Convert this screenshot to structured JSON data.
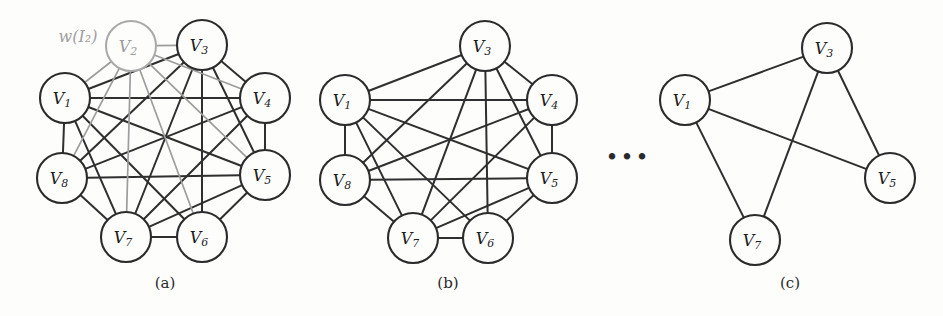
{
  "figure": {
    "width": 943,
    "height": 316,
    "background_color": "#fdfdfc",
    "node_stroke_color": "#2b2b2b",
    "edge_color": "#2f2f2f",
    "faded_color": "#9d9d9d",
    "node_radius": 25,
    "ellipsis_text": "•••",
    "ellipsis_x": 628,
    "ellipsis_y": 158
  },
  "annotation": {
    "label": "w(I₂)",
    "x": 78,
    "y": 36,
    "color": "#a0a0a0"
  },
  "panels": [
    {
      "id": "panel-a",
      "caption": "(a)",
      "caption_x": 165,
      "caption_y": 274,
      "nodes": [
        {
          "id": "V1",
          "label": "V",
          "sub": "1",
          "x": 65,
          "y": 98,
          "faded": false
        },
        {
          "id": "V2",
          "label": "V",
          "sub": "2",
          "x": 131,
          "y": 46,
          "faded": true
        },
        {
          "id": "V3",
          "label": "V",
          "sub": "3",
          "x": 202,
          "y": 45,
          "faded": false
        },
        {
          "id": "V4",
          "label": "V",
          "sub": "4",
          "x": 265,
          "y": 98,
          "faded": false
        },
        {
          "id": "V5",
          "label": "V",
          "sub": "5",
          "x": 265,
          "y": 175,
          "faded": false
        },
        {
          "id": "V6",
          "label": "V",
          "sub": "6",
          "x": 202,
          "y": 237,
          "faded": false
        },
        {
          "id": "V7",
          "label": "V",
          "sub": "7",
          "x": 126,
          "y": 237,
          "faded": false
        },
        {
          "id": "V8",
          "label": "V",
          "sub": "8",
          "x": 62,
          "y": 178,
          "faded": false
        }
      ],
      "edges": [
        {
          "from": "V1",
          "to": "V3",
          "faded": false
        },
        {
          "from": "V1",
          "to": "V4",
          "faded": false
        },
        {
          "from": "V1",
          "to": "V5",
          "faded": false
        },
        {
          "from": "V1",
          "to": "V6",
          "faded": false
        },
        {
          "from": "V1",
          "to": "V7",
          "faded": false
        },
        {
          "from": "V1",
          "to": "V8",
          "faded": false
        },
        {
          "from": "V3",
          "to": "V4",
          "faded": false
        },
        {
          "from": "V3",
          "to": "V5",
          "faded": false
        },
        {
          "from": "V3",
          "to": "V6",
          "faded": false
        },
        {
          "from": "V3",
          "to": "V7",
          "faded": false
        },
        {
          "from": "V3",
          "to": "V8",
          "faded": false
        },
        {
          "from": "V4",
          "to": "V5",
          "faded": false
        },
        {
          "from": "V4",
          "to": "V7",
          "faded": false
        },
        {
          "from": "V4",
          "to": "V8",
          "faded": false
        },
        {
          "from": "V5",
          "to": "V6",
          "faded": false
        },
        {
          "from": "V5",
          "to": "V7",
          "faded": false
        },
        {
          "from": "V5",
          "to": "V8",
          "faded": false
        },
        {
          "from": "V6",
          "to": "V7",
          "faded": false
        },
        {
          "from": "V7",
          "to": "V8",
          "faded": false
        },
        {
          "from": "V2",
          "to": "V1",
          "faded": true
        },
        {
          "from": "V2",
          "to": "V3",
          "faded": true
        },
        {
          "from": "V2",
          "to": "V4",
          "faded": true
        },
        {
          "from": "V2",
          "to": "V5",
          "faded": true
        },
        {
          "from": "V2",
          "to": "V6",
          "faded": true
        },
        {
          "from": "V2",
          "to": "V7",
          "faded": true
        },
        {
          "from": "V2",
          "to": "V8",
          "faded": true
        }
      ]
    },
    {
      "id": "panel-b",
      "caption": "(b)",
      "caption_x": 448,
      "caption_y": 274,
      "nodes": [
        {
          "id": "V1",
          "label": "V",
          "sub": "1",
          "x": 345,
          "y": 100,
          "faded": false
        },
        {
          "id": "V3",
          "label": "V",
          "sub": "3",
          "x": 485,
          "y": 46,
          "faded": false
        },
        {
          "id": "V4",
          "label": "V",
          "sub": "4",
          "x": 552,
          "y": 100,
          "faded": false
        },
        {
          "id": "V5",
          "label": "V",
          "sub": "5",
          "x": 552,
          "y": 178,
          "faded": false
        },
        {
          "id": "V6",
          "label": "V",
          "sub": "6",
          "x": 488,
          "y": 238,
          "faded": false
        },
        {
          "id": "V7",
          "label": "V",
          "sub": "7",
          "x": 413,
          "y": 238,
          "faded": false
        },
        {
          "id": "V8",
          "label": "V",
          "sub": "8",
          "x": 345,
          "y": 180,
          "faded": false
        }
      ],
      "edges": [
        {
          "from": "V1",
          "to": "V3",
          "faded": false
        },
        {
          "from": "V1",
          "to": "V4",
          "faded": false
        },
        {
          "from": "V1",
          "to": "V5",
          "faded": false
        },
        {
          "from": "V1",
          "to": "V6",
          "faded": false
        },
        {
          "from": "V1",
          "to": "V7",
          "faded": false
        },
        {
          "from": "V1",
          "to": "V8",
          "faded": false
        },
        {
          "from": "V3",
          "to": "V4",
          "faded": false
        },
        {
          "from": "V3",
          "to": "V5",
          "faded": false
        },
        {
          "from": "V3",
          "to": "V6",
          "faded": false
        },
        {
          "from": "V3",
          "to": "V7",
          "faded": false
        },
        {
          "from": "V3",
          "to": "V8",
          "faded": false
        },
        {
          "from": "V4",
          "to": "V5",
          "faded": false
        },
        {
          "from": "V4",
          "to": "V7",
          "faded": false
        },
        {
          "from": "V4",
          "to": "V8",
          "faded": false
        },
        {
          "from": "V5",
          "to": "V6",
          "faded": false
        },
        {
          "from": "V5",
          "to": "V7",
          "faded": false
        },
        {
          "from": "V5",
          "to": "V8",
          "faded": false
        },
        {
          "from": "V6",
          "to": "V7",
          "faded": false
        },
        {
          "from": "V7",
          "to": "V8",
          "faded": false
        }
      ]
    },
    {
      "id": "panel-c",
      "caption": "(c)",
      "caption_x": 790,
      "caption_y": 274,
      "nodes": [
        {
          "id": "V1",
          "label": "V",
          "sub": "1",
          "x": 685,
          "y": 100,
          "faded": false
        },
        {
          "id": "V3",
          "label": "V",
          "sub": "3",
          "x": 827,
          "y": 48,
          "faded": false
        },
        {
          "id": "V5",
          "label": "V",
          "sub": "5",
          "x": 890,
          "y": 178,
          "faded": false
        },
        {
          "id": "V7",
          "label": "V",
          "sub": "7",
          "x": 755,
          "y": 240,
          "faded": false
        }
      ],
      "edges": [
        {
          "from": "V1",
          "to": "V3",
          "faded": false
        },
        {
          "from": "V1",
          "to": "V5",
          "faded": false
        },
        {
          "from": "V1",
          "to": "V7",
          "faded": false
        },
        {
          "from": "V3",
          "to": "V5",
          "faded": false
        },
        {
          "from": "V3",
          "to": "V7",
          "faded": false
        }
      ]
    }
  ]
}
